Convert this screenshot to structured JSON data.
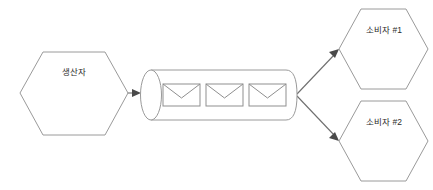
{
  "diagram": {
    "colors": {
      "background": "#ffffff",
      "node_stroke": "#9a9a9a",
      "node_fill": "#ffffff",
      "edge_stroke": "#6f6f6f",
      "arrowhead": "#4a4a4a",
      "icon_stroke": "#8f8f8f",
      "label_text": "#2b2b2b"
    },
    "nodes": {
      "producer": {
        "label": "생산자",
        "shape": "hexagon"
      },
      "queue": {
        "label": "",
        "shape": "cylinder",
        "message_count": 3,
        "messages": [
          {
            "icon": "envelope-icon"
          },
          {
            "icon": "envelope-icon"
          },
          {
            "icon": "envelope-icon"
          }
        ]
      },
      "consumer_1": {
        "label": "소비자 #1",
        "shape": "hexagon"
      },
      "consumer_2": {
        "label": "소비자 #2",
        "shape": "hexagon"
      }
    },
    "edges": [
      {
        "from": "producer",
        "to": "queue",
        "label": ""
      },
      {
        "from": "queue",
        "to": "consumer_1",
        "label": ""
      },
      {
        "from": "queue",
        "to": "consumer_2",
        "label": ""
      }
    ]
  }
}
